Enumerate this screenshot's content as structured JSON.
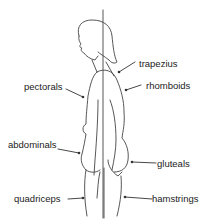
{
  "diagram": {
    "labels": {
      "trapezius": "trapezius",
      "rhomboids": "rhomboids",
      "pectorals": "pectorals",
      "abdominals": "abdominals",
      "gluteals": "gluteals",
      "quadriceps": "quadriceps",
      "hamstrings": "hamstrings"
    },
    "colors": {
      "line": "#333333",
      "background": "#ffffff",
      "text": "#222222"
    }
  }
}
